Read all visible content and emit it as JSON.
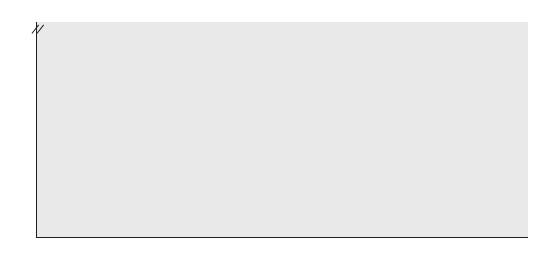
{
  "chart_data": {
    "type": "line",
    "title": "",
    "ylabel": "Percent",
    "xlabel": "",
    "grid": true,
    "legend_position": "inline-annotations",
    "axis_break": "// between 35 and 100",
    "x": [
      1985,
      1988,
      1990,
      1991,
      1993,
      1995,
      1997,
      1999,
      2002,
      2005,
      2010
    ],
    "x_tick_labels": [
      "1985",
      "1990",
      "1995",
      "1999",
      "2002",
      "2005",
      "2010"
    ],
    "y_tick_labels": [
      "0",
      "5",
      "10",
      "15",
      "20",
      "25",
      "30",
      "35",
      "100"
    ],
    "ylim": [
      0,
      35
    ],
    "series": [
      {
        "name": "Center-based care",
        "color": "#4a4a4a",
        "values": [
          28.5,
          29.2,
          25.4,
          22.1,
          30.2,
          25.5,
          21.3,
          22.7,
          23.9,
          24.1,
          24.2
        ]
      },
      {
        "name": "Other nonrelative care",
        "color": "#4a4a4a",
        "values": [
          23.4,
          25.9,
          27.7,
          23.5,
          22.0,
          28.8,
          20.8,
          18.8,
          17.3,
          16.0,
          13.8
        ]
      },
      {
        "name": "Father care",
        "color": "#9a9a9a",
        "values": [
          16.0,
          15.4,
          16.7,
          20.2,
          16.3,
          16.6,
          17.8,
          18.5,
          18.8,
          19.0,
          19.2
        ]
      },
      {
        "name": "Grandparent care",
        "color": "#bdbdbd",
        "values": [
          15.9,
          14.2,
          14.4,
          15.8,
          17.0,
          15.9,
          16.5,
          17.0,
          18.2,
          17.4,
          18.8
        ]
      },
      {
        "name": "Mother care",
        "color": "#6e6e6e",
        "values": [
          8.1,
          7.2,
          8.9,
          8.2,
          9.1,
          5.5,
          7.5,
          8.5,
          6.9,
          6.9,
          5.9
        ]
      },
      {
        "name": "Other relative care",
        "color": "#9a9a9a",
        "values": [
          8.1,
          7.2,
          6.4,
          8.2,
          7.0,
          5.5,
          3.8,
          4.0,
          3.9,
          5.2,
          5.1
        ]
      }
    ],
    "annotations": [
      {
        "text": "Center-based care",
        "id": "ann-center-based-care"
      },
      {
        "text": "Other nonrelative care",
        "id": "ann-other-nonrelative-care"
      },
      {
        "text": "Father care",
        "id": "ann-father-care"
      },
      {
        "text": "Grandparent care",
        "id": "ann-grandparent-care"
      },
      {
        "text": "Other relative care",
        "id": "ann-other-relative-care"
      },
      {
        "text": "Mother care",
        "id": "ann-mother-care"
      }
    ]
  },
  "y_axis": {
    "title": "Percent",
    "ticks": [
      "100",
      "35",
      "30",
      "25",
      "20",
      "15",
      "10",
      "5",
      "0"
    ]
  },
  "x_axis": {
    "ticks": [
      "1985",
      "1990",
      "1995",
      "1999",
      "2002",
      "2005",
      "2010"
    ]
  }
}
